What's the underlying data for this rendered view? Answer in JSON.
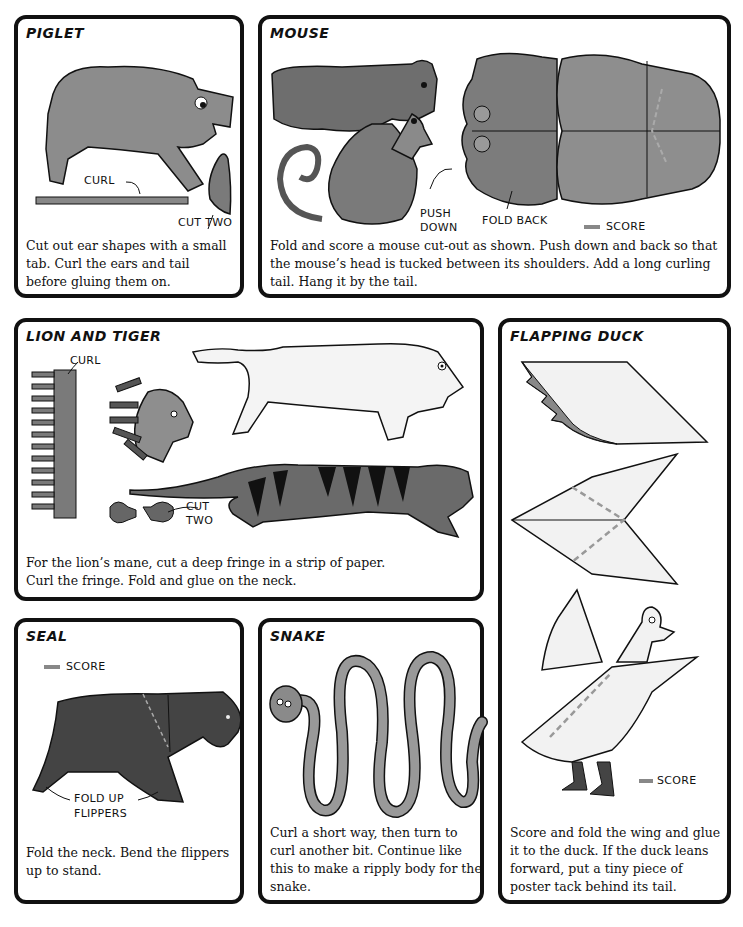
{
  "page": {
    "accent_colors": {
      "border": "#111111",
      "paper_gray": "#8a8a8a",
      "dark_gray": "#3a3a3a",
      "score_line": "#888888"
    }
  },
  "panels": {
    "piglet": {
      "title": "PIGLET",
      "labels": {
        "curl": "CURL",
        "cut_two": "CUT TWO"
      },
      "text": "Cut out ear shapes with a small tab. Curl the ears and tail before gluing them on."
    },
    "mouse": {
      "title": "MOUSE",
      "labels": {
        "push": "PUSH",
        "down": "DOWN",
        "fold_back": "FOLD BACK",
        "score": "SCORE"
      },
      "text": "Fold and score a mouse cut-out as shown. Push down and back so that the mouse’s head is tucked between its shoulders. Add a long curling tail. Hang it by the tail."
    },
    "lion_tiger": {
      "title": "LION AND TIGER",
      "labels": {
        "curl": "CURL",
        "cut": "CUT",
        "two": "TWO"
      },
      "text": "For the lion’s mane, cut a deep fringe in a strip of paper. Curl the fringe. Fold and glue on the neck."
    },
    "duck": {
      "title": "FLAPPING DUCK",
      "labels": {
        "score": "SCORE"
      },
      "text": "Score and fold the wing and glue it to the duck. If the duck leans forward, put a tiny piece of poster tack behind its tail."
    },
    "seal": {
      "title": "SEAL",
      "labels": {
        "score": "SCORE",
        "fold_up": "FOLD UP",
        "flippers": "FLIPPERS"
      },
      "text": "Fold the neck. Bend the flippers up to stand."
    },
    "snake": {
      "title": "SNAKE",
      "text": "Curl a short way, then turn to curl another bit. Continue like this to make a ripply body for the snake."
    }
  }
}
